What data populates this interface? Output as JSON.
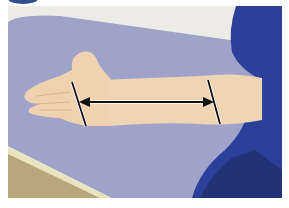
{
  "figure": {
    "colors": {
      "wall": "#ecebe6",
      "table_top": "#9fa3c9",
      "table_edge": "#e9e3bf",
      "floor": "#b8a77a",
      "skin": "#efd5b3",
      "sleeve": "#2c3f9a",
      "marker": "#111111",
      "badge": "#2f4f8f"
    },
    "annotation": {
      "type": "double-headed-arrow",
      "start_marker": "wrist-line",
      "end_marker": "elbow-line"
    }
  }
}
